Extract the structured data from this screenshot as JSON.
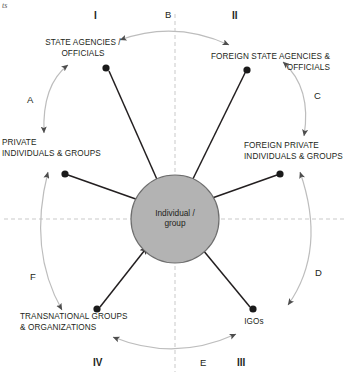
{
  "page": {
    "corner_note": "ts",
    "width": 351,
    "height": 375,
    "bg_color": "#ffffff",
    "line_color": "#231f20",
    "arc_color": "#b9b9b9",
    "axis_color": "#bdbdbd",
    "hub_fill": "#b3b3b3",
    "hub_stroke": "#6e6e6e"
  },
  "hub": {
    "label": "Individual /\ngroup",
    "name": "individual-group-hub"
  },
  "nodes": [
    {
      "id": "state-agencies",
      "label": "STATE AGENCIES /\nOFFICIALS",
      "align": "center"
    },
    {
      "id": "foreign-state-agencies",
      "label": "FOREIGN STATE AGENCIES &\nOFFICIALS",
      "align": "right"
    },
    {
      "id": "private-individuals",
      "label": "PRIVATE\nINDIVIDUALS & GROUPS",
      "align": "left"
    },
    {
      "id": "foreign-private",
      "label": "FOREIGN PRIVATE\nINDIVIDUALS & GROUPS",
      "align": "left"
    },
    {
      "id": "transnational-groups",
      "label": "TRANSNATIONAL GROUPS\n& ORGANIZATIONS",
      "align": "left"
    },
    {
      "id": "igos",
      "label": "IGOs",
      "align": "center"
    }
  ],
  "quadrants": [
    {
      "id": "quadrant-i",
      "label": "I"
    },
    {
      "id": "quadrant-ii",
      "label": "II"
    },
    {
      "id": "quadrant-iii",
      "label": "III"
    },
    {
      "id": "quadrant-iv",
      "label": "IV"
    }
  ],
  "arcs": [
    {
      "id": "arc-a",
      "label": "A",
      "from": "state-agencies",
      "to": "private-individuals",
      "bidirectional": true
    },
    {
      "id": "arc-b",
      "label": "B",
      "from": "state-agencies",
      "to": "foreign-state-agencies",
      "bidirectional": true
    },
    {
      "id": "arc-c",
      "label": "C",
      "from": "foreign-state-agencies",
      "to": "foreign-private",
      "bidirectional": true
    },
    {
      "id": "arc-d",
      "label": "D",
      "from": "foreign-private",
      "to": "igos",
      "bidirectional": true
    },
    {
      "id": "arc-e",
      "label": "E",
      "from": "transnational-groups",
      "to": "igos",
      "bidirectional": true
    },
    {
      "id": "arc-f",
      "label": "F",
      "from": "private-individuals",
      "to": "transnational-groups",
      "bidirectional": true
    }
  ],
  "spokes": [
    {
      "id": "spoke-state-agencies",
      "from": "state-agencies",
      "to": "hub",
      "direction": "inward"
    },
    {
      "id": "spoke-foreign-state-agencies",
      "from": "foreign-state-agencies",
      "to": "hub",
      "direction": "inward"
    },
    {
      "id": "spoke-private-individuals",
      "from": "private-individuals",
      "to": "hub",
      "direction": "inward"
    },
    {
      "id": "spoke-foreign-private",
      "from": "foreign-private",
      "to": "hub",
      "direction": "inward"
    },
    {
      "id": "spoke-transnational-groups",
      "from": "transnational-groups",
      "to": "hub",
      "direction": "inward"
    },
    {
      "id": "spoke-igos",
      "from": "igos",
      "to": "hub",
      "direction": "inward"
    }
  ]
}
